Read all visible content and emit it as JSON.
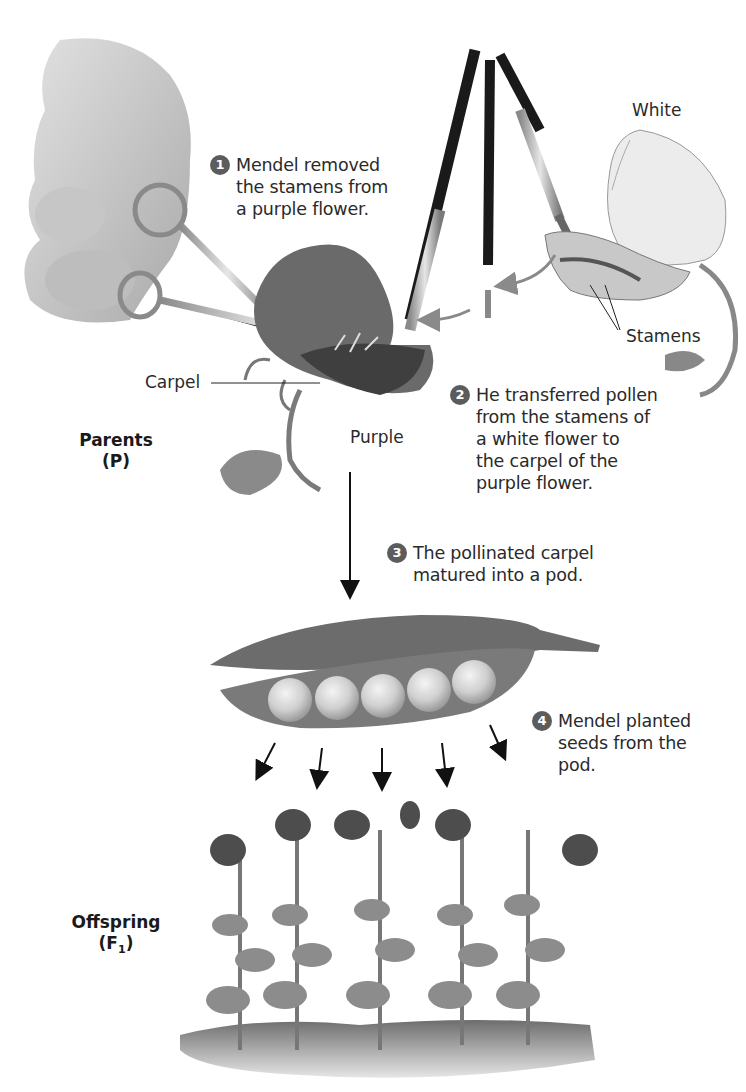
{
  "figure": {
    "steps": [
      {
        "number": "1",
        "lines": [
          "Mendel removed",
          "the stamens from",
          "a purple flower."
        ]
      },
      {
        "number": "2",
        "lines": [
          "He transferred pollen",
          "from the stamens of",
          "a white flower to",
          "the carpel of the",
          "purple flower."
        ]
      },
      {
        "number": "3",
        "lines": [
          "The pollinated carpel",
          "matured into a pod."
        ]
      },
      {
        "number": "4",
        "lines": [
          "Mendel planted",
          "seeds from the",
          "pod."
        ]
      }
    ],
    "labels": {
      "white": "White",
      "stamens": "Stamens",
      "carpel": "Carpel",
      "purple": "Purple"
    },
    "generations": {
      "parents": {
        "name": "Parents",
        "symbol": "(P)"
      },
      "offspring": {
        "name": "Offspring",
        "symbol_prefix": "(F",
        "symbol_sub": "1",
        "symbol_suffix": ")"
      }
    },
    "colors": {
      "badge": "#5c5c5c",
      "arrow_gray": "#8a8a8a",
      "arrow_black": "#111111",
      "text": "#2a2a2a"
    },
    "illustrations": [
      "hand-with-scissors",
      "purple-flower",
      "paintbrushes",
      "white-flower",
      "pea-pod",
      "offspring-plants"
    ]
  }
}
